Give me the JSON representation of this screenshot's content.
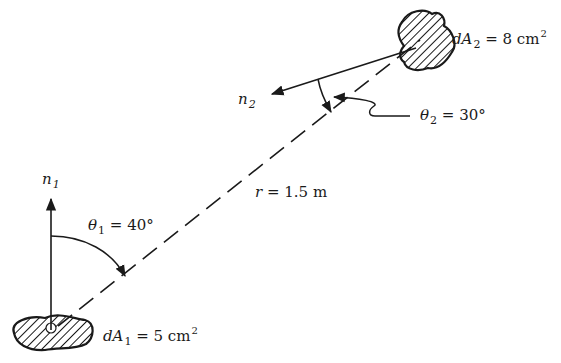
{
  "diagram": {
    "type": "radiation view-factor geometry between two differential surfaces",
    "surface1": {
      "name": "dA",
      "subscript": "1",
      "equals": "= 5 cm",
      "exponent": "2",
      "normal_symbol": "n",
      "normal_subscript": "1"
    },
    "surface2": {
      "name": "dA",
      "subscript": "2",
      "equals": "= 8 cm",
      "exponent": "2",
      "normal_symbol": "n",
      "normal_subscript": "2"
    },
    "angle1": {
      "symbol": "θ",
      "subscript": "1",
      "value": "= 40°"
    },
    "angle2": {
      "symbol": "θ",
      "subscript": "2",
      "value": "= 30°"
    },
    "distance": {
      "symbol": "r",
      "value": "= 1.5 m"
    },
    "colors": {
      "ink": "#1a1a1a",
      "background": "#ffffff"
    }
  }
}
